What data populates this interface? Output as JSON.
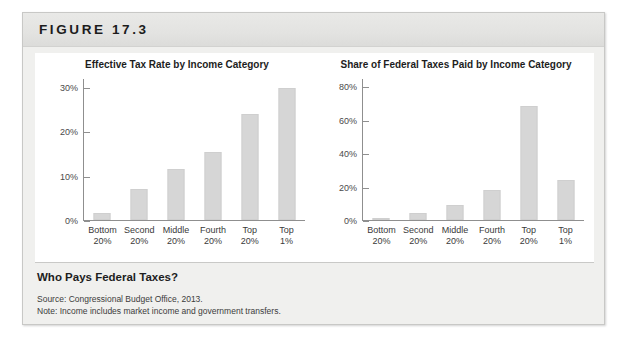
{
  "figure": {
    "label": "FIGURE 17.3",
    "caption_title": "Who Pays Federal Taxes?",
    "source": "Source: Congressional Budget Office, 2013.",
    "note": "Note: Income includes market income and government transfers."
  },
  "chart_data": [
    {
      "type": "bar",
      "title": "Effective Tax Rate by Income Category",
      "categories": [
        "Bottom 20%",
        "Second 20%",
        "Middle 20%",
        "Fourth 20%",
        "Top 20%",
        "Top 1%"
      ],
      "category_lines": [
        [
          "Bottom",
          "20%"
        ],
        [
          "Second",
          "20%"
        ],
        [
          "Middle",
          "20%"
        ],
        [
          "Fourth",
          "20%"
        ],
        [
          "Top",
          "20%"
        ],
        [
          "Top",
          "1%"
        ]
      ],
      "values": [
        1.5,
        7,
        11.5,
        15.5,
        24,
        30
      ],
      "xlabel": "",
      "ylabel": "",
      "ylim": [
        0,
        32
      ],
      "yticks": [
        0,
        10,
        20,
        30
      ],
      "ytick_labels": [
        "0%",
        "10%",
        "20%",
        "30%"
      ],
      "grid": false,
      "legend": "none",
      "bar_color": "#d6d6d6"
    },
    {
      "type": "bar",
      "title": "Share of Federal Taxes Paid by Income Category",
      "categories": [
        "Bottom 20%",
        "Second 20%",
        "Middle 20%",
        "Fourth 20%",
        "Top 20%",
        "Top 1%"
      ],
      "category_lines": [
        [
          "Bottom",
          "20%"
        ],
        [
          "Second",
          "20%"
        ],
        [
          "Middle",
          "20%"
        ],
        [
          "Fourth",
          "20%"
        ],
        [
          "Top",
          "20%"
        ],
        [
          "Top",
          "1%"
        ]
      ],
      "values": [
        0.5,
        4,
        9,
        18,
        69,
        24
      ],
      "xlabel": "",
      "ylabel": "",
      "ylim": [
        0,
        85
      ],
      "yticks": [
        0,
        20,
        40,
        60,
        80
      ],
      "ytick_labels": [
        "0%",
        "20%",
        "40%",
        "60%",
        "80%"
      ],
      "grid": false,
      "legend": "none",
      "bar_color": "#d6d6d6"
    }
  ]
}
